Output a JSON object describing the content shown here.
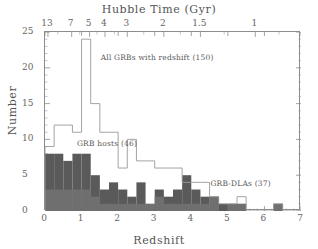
{
  "figure": {
    "top_axis_title": "Hubble Time (Gyr)",
    "bottom_axis_title": "Redshift",
    "y_axis_title": "Number"
  },
  "chart_data": {
    "type": "bar",
    "title": "",
    "xlabel": "Redshift",
    "ylabel": "Number",
    "top_xlabel": "Hubble Time (Gyr)",
    "xlim": [
      0,
      7
    ],
    "ylim": [
      0,
      25
    ],
    "bin_width": 0.25,
    "grid": false,
    "legend_position": "inline-annotations",
    "x_ticks": [
      0,
      1,
      2,
      3,
      4,
      5,
      6,
      7
    ],
    "y_ticks": [
      0,
      5,
      10,
      15,
      20,
      25
    ],
    "top_axis_ticks": [
      {
        "label": "13",
        "redshift": 0.08
      },
      {
        "label": "7",
        "redshift": 0.73
      },
      {
        "label": "5",
        "redshift": 1.22
      },
      {
        "label": "4",
        "redshift": 1.64
      },
      {
        "label": "3",
        "redshift": 2.25
      },
      {
        "label": "2",
        "redshift": 3.25
      },
      {
        "label": "1.5",
        "redshift": 4.25
      },
      {
        "label": "1",
        "redshift": 5.75
      }
    ],
    "top_axis_minor_ticks": [
      0.35,
      0.95,
      1.42,
      1.9,
      2.7,
      3.7,
      4.9,
      6.4
    ],
    "bin_edges": [
      0,
      0.25,
      0.5,
      0.75,
      1.0,
      1.25,
      1.5,
      1.75,
      2.0,
      2.25,
      2.5,
      2.75,
      3.0,
      3.25,
      3.5,
      3.75,
      4.0,
      4.25,
      4.5,
      4.75,
      5.0,
      5.25,
      5.5,
      5.75,
      6.0,
      6.25,
      6.5,
      6.75,
      7.0
    ],
    "series": [
      {
        "name": "All GRBs with redshift (150)",
        "style": "open-step",
        "color": "#ffffff",
        "edge_color": "#9a9a9a",
        "count_label": "150",
        "values": [
          9,
          12,
          12,
          11,
          24,
          15,
          11,
          11,
          6,
          10,
          7,
          7,
          6,
          6,
          6,
          4,
          4,
          4,
          2,
          1,
          1,
          2,
          0,
          0,
          0,
          1,
          0,
          0
        ]
      },
      {
        "name": "GRB hosts (46)",
        "style": "filled",
        "color": "#5a5a5a",
        "count_label": "46",
        "values": [
          8,
          8,
          7,
          8,
          8,
          5,
          3,
          4,
          3,
          2,
          4,
          1,
          3,
          2,
          3,
          5,
          3,
          2,
          2,
          1,
          1,
          1,
          0,
          0,
          0,
          1,
          0,
          0
        ]
      },
      {
        "name": "GRB-DLAs (37)",
        "style": "filled-dark",
        "color": "#6b6b6b",
        "count_label": "37",
        "values": [
          3,
          3,
          3,
          3,
          3,
          2,
          1,
          1,
          1,
          1,
          1,
          1,
          2,
          1,
          1,
          1,
          1,
          1,
          2,
          0,
          1,
          1,
          0,
          0,
          0,
          1,
          0,
          0
        ]
      }
    ],
    "annotations": [
      {
        "text": "All GRBs with redshift (150)",
        "x": 1.55,
        "y": 21.2
      },
      {
        "text": "GRB hosts (46)",
        "x": 0.9,
        "y": 9.2
      },
      {
        "text": "GRB-DLAs (37)",
        "x": 4.55,
        "y": 3.6
      }
    ]
  }
}
